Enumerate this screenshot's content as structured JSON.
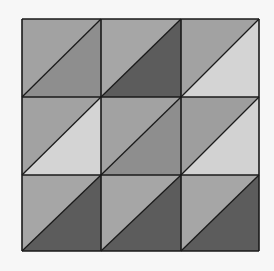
{
  "grid": {
    "rows": 3,
    "cols": 3,
    "x": [
      22,
      101,
      181,
      259
    ],
    "y": [
      19,
      97,
      175,
      251
    ],
    "stroke": "#1a1a1a",
    "cells": [
      {
        "upper": "#a2a2a2",
        "lower": "#8e8e8e"
      },
      {
        "upper": "#a6a6a6",
        "lower": "#5c5c5c"
      },
      {
        "upper": "#a2a2a2",
        "lower": "#d4d4d4"
      },
      {
        "upper": "#a2a2a2",
        "lower": "#d4d4d4"
      },
      {
        "upper": "#a2a2a2",
        "lower": "#8e8e8e"
      },
      {
        "upper": "#9e9e9e",
        "lower": "#d2d2d2"
      },
      {
        "upper": "#a6a6a6",
        "lower": "#5c5c5c"
      },
      {
        "upper": "#a6a6a6",
        "lower": "#5c5c5c"
      },
      {
        "upper": "#a6a6a6",
        "lower": "#5c5c5c"
      }
    ]
  }
}
